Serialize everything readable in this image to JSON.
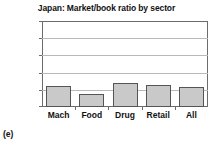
{
  "figure": {
    "panel_label": "(e)"
  },
  "chart_data": {
    "type": "bar",
    "title": "Japan: Market/book ratio by sector",
    "xlabel": "",
    "ylabel": "",
    "categories": [
      "Mach",
      "Food",
      "Drug",
      "Retail",
      "All"
    ],
    "values": [
      2.4,
      1.5,
      2.8,
      2.6,
      2.3
    ],
    "ylim": [
      0.0,
      10.0
    ],
    "ytick_labels": [
      "0.0",
      "2.0",
      "4.0",
      "6.0",
      "8.0",
      "10.0"
    ],
    "ytick_values": [
      0.0,
      2.0,
      4.0,
      6.0,
      8.0,
      10.0
    ],
    "grid": true,
    "legend": false,
    "colors": {
      "bar_fill": "#c9c9c9",
      "bar_edge": "#555555",
      "gridline": "#b9b9b9",
      "axis": "#6b6b6b",
      "text": "#111111",
      "background": "#ffffff"
    }
  }
}
